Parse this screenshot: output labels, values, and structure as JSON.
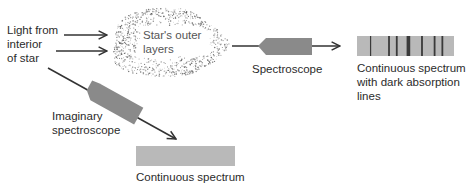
{
  "labels": {
    "light_source": [
      "Light from",
      "interior",
      "of star"
    ],
    "outer_layers": [
      "Star's outer",
      "layers"
    ],
    "spectroscope": "Spectroscope",
    "absorption_spectrum": [
      "Continuous spectrum",
      "with dark absorption",
      "lines"
    ],
    "imaginary_spectroscope": [
      "Imaginary",
      "spectroscope"
    ],
    "continuous_spectrum": "Continuous spectrum"
  },
  "colors": {
    "line": "#333333",
    "spectroscope_body": "#8a8a8a",
    "spectrum_fill": "#b9b9b9",
    "absorption_line": "#3a3a3a",
    "speckle": "#555555"
  },
  "absorption_lines": [
    {
      "pos": 0.14,
      "weight": 1
    },
    {
      "pos": 0.33,
      "weight": 1.5
    },
    {
      "pos": 0.41,
      "weight": 1.5
    },
    {
      "pos": 0.53,
      "weight": 3
    },
    {
      "pos": 0.67,
      "weight": 1.5
    },
    {
      "pos": 0.8,
      "weight": 1.5
    },
    {
      "pos": 0.88,
      "weight": 1.5
    }
  ]
}
